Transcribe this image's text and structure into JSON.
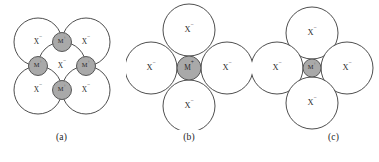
{
  "figure": {
    "kind": "ionic-packing-radius-ratio-diagram",
    "background_color": "#ffffff",
    "anion_label": "X",
    "anion_charge": "−",
    "cation_label": "M",
    "cation_charge": "+",
    "anion_fill": "#ffffff",
    "anion_stroke": "#3a3a3a",
    "cation_fill": "#a9a9a9",
    "cation_stroke": "#4a4a4a",
    "guide_line_color": "#8e8e8e"
  },
  "panels": [
    {
      "id": "a",
      "caption": "(a)",
      "description": "two-dimensional ionic lattice slice: five large anions at square corners and center with four small cations at edge midpoints, dashed construction square and diagonals",
      "anion_radius": 24,
      "cation_radius": 9.5,
      "anions": [
        {
          "name": "anion-top-left",
          "cx": 38,
          "cy": 42,
          "label_dx": 0,
          "label_dy": 0
        },
        {
          "name": "anion-top-right",
          "cx": 86,
          "cy": 42,
          "label_dx": 0,
          "label_dy": 0
        },
        {
          "name": "anion-center",
          "cx": 62,
          "cy": 66,
          "label_dx": 0,
          "label_dy": 0
        },
        {
          "name": "anion-bottom-left",
          "cx": 38,
          "cy": 90,
          "label_dx": 0,
          "label_dy": 0
        },
        {
          "name": "anion-bottom-right",
          "cx": 86,
          "cy": 90,
          "label_dx": 0,
          "label_dy": 0
        }
      ],
      "cations": [
        {
          "name": "cation-top",
          "cx": 62,
          "cy": 42
        },
        {
          "name": "cation-left",
          "cx": 38,
          "cy": 66
        },
        {
          "name": "cation-right",
          "cx": 86,
          "cy": 66
        },
        {
          "name": "cation-bottom",
          "cx": 62,
          "cy": 90
        }
      ],
      "guides": [
        {
          "name": "guide-square-top",
          "x1": 62,
          "y1": 42,
          "x2": 38,
          "y2": 66
        },
        {
          "name": "guide-square-right",
          "x1": 62,
          "y1": 42,
          "x2": 86,
          "y2": 66
        },
        {
          "name": "guide-square-bottom",
          "x1": 38,
          "y1": 66,
          "x2": 62,
          "y2": 90
        },
        {
          "name": "guide-square-left",
          "x1": 86,
          "y1": 66,
          "x2": 62,
          "y2": 90
        },
        {
          "name": "guide-vertical",
          "x1": 62,
          "y1": 42,
          "x2": 62,
          "y2": 90
        },
        {
          "name": "guide-horizontal",
          "x1": 38,
          "y1": 66,
          "x2": 86,
          "y2": 66
        },
        {
          "name": "guide-diagonal-main",
          "x1": 38,
          "y1": 42,
          "x2": 86,
          "y2": 90
        },
        {
          "name": "guide-diagonal-anti",
          "x1": 38,
          "y1": 90,
          "x2": 86,
          "y2": 42
        }
      ]
    },
    {
      "id": "b",
      "caption": "(b)",
      "description": "four anions around a cation that exactly fills the hole; neighbouring anions do not touch",
      "anion_radius": 26,
      "cation_radius": 12,
      "center_x": 63,
      "center_y": 68,
      "offset": 38,
      "anions": [
        {
          "name": "anion-top",
          "cx": 63,
          "cy": 30
        },
        {
          "name": "anion-left",
          "cx": 25,
          "cy": 68
        },
        {
          "name": "anion-right",
          "cx": 101,
          "cy": 68
        },
        {
          "name": "anion-bottom",
          "cx": 63,
          "cy": 106
        }
      ],
      "cations": [
        {
          "name": "cation-center",
          "cx": 63,
          "cy": 68
        }
      ]
    },
    {
      "id": "c",
      "caption": "(c)",
      "description": "four anions around a cation too small for the hole; neighbouring anions touch each other",
      "anion_radius": 26,
      "cation_radius": 9,
      "center_x": 60,
      "center_y": 68,
      "offset": 35,
      "anions": [
        {
          "name": "anion-top",
          "cx": 60,
          "cy": 33
        },
        {
          "name": "anion-left",
          "cx": 25,
          "cy": 68
        },
        {
          "name": "anion-right",
          "cx": 95,
          "cy": 68
        },
        {
          "name": "anion-bottom",
          "cx": 60,
          "cy": 103
        }
      ],
      "cations": [
        {
          "name": "cation-center",
          "cx": 60,
          "cy": 68
        }
      ]
    }
  ]
}
